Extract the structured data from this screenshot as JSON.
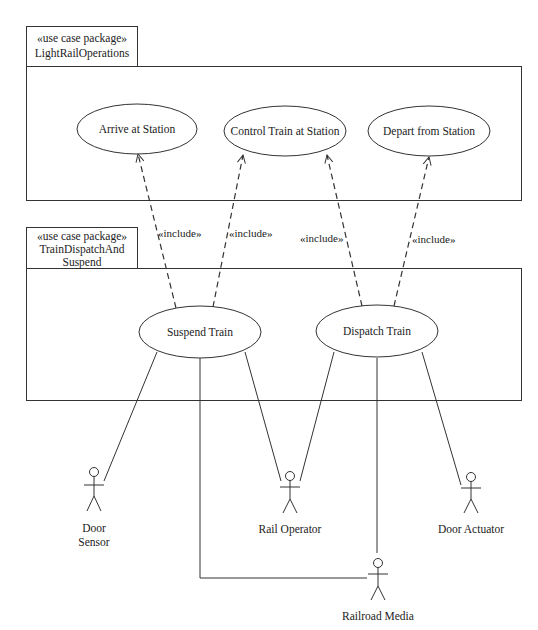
{
  "diagram": {
    "type": "UML use case diagram",
    "packages": [
      {
        "id": "pkg-light-rail",
        "stereotype": "«use case package»",
        "name_lines": [
          "LightRailOperations"
        ],
        "tab": {
          "x": 26,
          "y": 26,
          "w": 111,
          "h": 40
        },
        "box": {
          "x": 26,
          "y": 66,
          "w": 495,
          "h": 134
        }
      },
      {
        "id": "pkg-train-dispatch",
        "stereotype": "«use case package»",
        "name_lines": [
          "TrainDispatchAnd",
          "Suspend"
        ],
        "tab": {
          "x": 26,
          "y": 227,
          "w": 111,
          "h": 41
        },
        "box": {
          "x": 26,
          "y": 268,
          "w": 495,
          "h": 132
        }
      }
    ],
    "use_cases": [
      {
        "id": "uc-arrive",
        "label": "Arrive at Station",
        "cx": 137,
        "cy": 129,
        "rx": 60,
        "ry": 25
      },
      {
        "id": "uc-control",
        "label": "Control Train at Station",
        "cx": 285,
        "cy": 131,
        "rx": 61,
        "ry": 25
      },
      {
        "id": "uc-depart",
        "label": "Depart from Station",
        "cx": 429,
        "cy": 131,
        "rx": 61,
        "ry": 25
      },
      {
        "id": "uc-suspend",
        "label": "Suspend Train",
        "cx": 200,
        "cy": 332,
        "rx": 61,
        "ry": 26
      },
      {
        "id": "uc-dispatch",
        "label": "Dispatch Train",
        "cx": 377,
        "cy": 331,
        "rx": 61,
        "ry": 26
      }
    ],
    "actors": [
      {
        "id": "actor-door-sensor",
        "label_lines": [
          "Door",
          "Sensor"
        ],
        "x": 94,
        "head_y": 472,
        "label_y": 530
      },
      {
        "id": "actor-rail-operator",
        "label_lines": [
          "Rail Operator"
        ],
        "x": 290,
        "head_y": 476,
        "label_y": 531
      },
      {
        "id": "actor-door-actuator",
        "label_lines": [
          "Door Actuator"
        ],
        "x": 471,
        "head_y": 477,
        "label_y": 531
      },
      {
        "id": "actor-railroad-media",
        "label_lines": [
          "Railroad Media"
        ],
        "x": 378,
        "head_y": 563,
        "label_y": 618
      }
    ],
    "include_relations": [
      {
        "from": "Suspend Train",
        "to": "Arrive at Station",
        "label": "«include»",
        "x1": 176,
        "y1": 308,
        "x2": 138,
        "y2": 154,
        "lx": 157,
        "ly": 237
      },
      {
        "from": "Suspend Train",
        "to": "Control Train at Station",
        "label": "«include»",
        "x1": 213,
        "y1": 307,
        "x2": 243,
        "y2": 155,
        "lx": 229,
        "ly": 237
      },
      {
        "from": "Dispatch Train",
        "to": "Control Train at Station",
        "label": "«include»",
        "x1": 362,
        "y1": 306,
        "x2": 327,
        "y2": 155,
        "lx": 300,
        "ly": 242
      },
      {
        "from": "Dispatch Train",
        "to": "Depart from Station",
        "label": "«include»",
        "x1": 394,
        "y1": 306,
        "x2": 429,
        "y2": 157,
        "lx": 411,
        "ly": 243
      }
    ],
    "associations": [
      {
        "from": "Suspend Train",
        "to": "Door Sensor",
        "points": "157,352 104,481"
      },
      {
        "from": "Suspend Train",
        "to": "Rail Operator",
        "points": "245,352 281,481"
      },
      {
        "from": "Suspend Train",
        "to": "Railroad Media",
        "points": "200,358 200,578 367,578"
      },
      {
        "from": "Dispatch Train",
        "to": "Rail Operator",
        "points": "334,352 300,481"
      },
      {
        "from": "Dispatch Train",
        "to": "Railroad Media",
        "points": "377,358 377,553"
      },
      {
        "from": "Dispatch Train",
        "to": "Door Actuator",
        "points": "422,352 461,485"
      }
    ]
  },
  "labels": {
    "pkg1_stereotype": "«use case package»",
    "pkg1_name": "LightRailOperations",
    "pkg2_stereotype": "«use case package»",
    "pkg2_name_line1": "TrainDispatchAnd",
    "pkg2_name_line2": "Suspend",
    "uc_arrive": "Arrive at Station",
    "uc_control": "Control Train at Station",
    "uc_depart": "Depart from Station",
    "uc_suspend": "Suspend Train",
    "uc_dispatch": "Dispatch Train",
    "include": "«include»",
    "actor_door_sensor_1": "Door",
    "actor_door_sensor_2": "Sensor",
    "actor_rail_operator": "Rail Operator",
    "actor_door_actuator": "Door Actuator",
    "actor_railroad_media": "Railroad Media"
  },
  "colors": {
    "line": "#333333",
    "background": "#ffffff"
  }
}
